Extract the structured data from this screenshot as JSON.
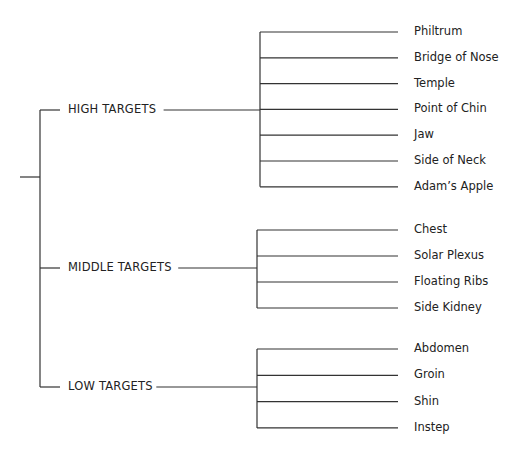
{
  "diagram": {
    "type": "tree",
    "categories": [
      {
        "label": "HIGH TARGETS",
        "children": [
          "Philtrum",
          "Bridge of Nose",
          "Temple",
          "Point of Chin",
          "Jaw",
          "Side of Neck",
          "Adam’s Apple"
        ]
      },
      {
        "label": "MIDDLE TARGETS",
        "children": [
          "Chest",
          "Solar Plexus",
          "Floating Ribs",
          "Side Kidney"
        ]
      },
      {
        "label": "LOW TARGETS",
        "children": [
          "Abdomen",
          "Groin",
          "Shin",
          "Instep"
        ]
      }
    ]
  }
}
